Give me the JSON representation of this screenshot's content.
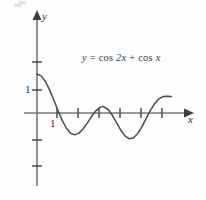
{
  "figure": {
    "title": "",
    "equation_plain": "y = cos 2x + cos x",
    "equation_parts": {
      "lhs_var": "y",
      "equals": "=",
      "term1_fn": "cos",
      "term1_arg": "2x",
      "plus": "+",
      "term2_fn": "cos",
      "term2_arg": "x"
    },
    "axis_label_x": "x",
    "axis_label_y": "y",
    "ytick_label": "1",
    "xtick_label": "1",
    "colors": {
      "curve": "#4a4a4a",
      "axis": "#5a5a5a",
      "text": "#2b2b2b",
      "background": "#fdfdfd"
    }
  },
  "chart_data": {
    "type": "line",
    "title": "",
    "subtitle": "",
    "xlabel": "x",
    "ylabel": "y",
    "annotations": [
      {
        "text": "y = cos 2x + cos x",
        "x": 3.9,
        "y": 1.95
      }
    ],
    "grid": false,
    "legend": null,
    "xlim": [
      -0.75,
      7.6
    ],
    "ylim": [
      -2.6,
      3.1
    ],
    "xticks": [
      1,
      2,
      3,
      4,
      5
    ],
    "xtick_labels": [
      "1",
      "",
      "",
      "",
      ""
    ],
    "yticks": [
      -2,
      -1,
      1,
      2
    ],
    "ytick_labels": [
      "",
      "",
      "1",
      ""
    ],
    "axes_arrows": {
      "x_positive": true,
      "y_positive": true
    },
    "series": [
      {
        "name": "y = cos 2x + cos x",
        "formula": "cos(2x) + cos(x)",
        "x": [
          0,
          0.2,
          0.4,
          0.6,
          0.8,
          1.0,
          1.2,
          1.4,
          1.6,
          1.8,
          2.0,
          2.2,
          2.4,
          2.6,
          2.8,
          3.0,
          3.14159,
          3.4,
          3.6,
          3.8,
          4.0,
          4.2,
          4.4,
          4.6,
          4.8,
          5.0,
          5.2,
          5.4,
          5.6,
          5.8,
          6.0,
          6.2,
          6.4
        ],
        "y": [
          2.0,
          1.902,
          1.617,
          1.187,
          0.67,
          0.124,
          -0.38,
          -0.783,
          -1.04,
          -1.12,
          -1.033,
          -0.81,
          -0.503,
          -0.177,
          0.106,
          0.29,
          0.34,
          0.167,
          -0.142,
          -0.522,
          -0.9,
          -1.188,
          -1.323,
          -1.273,
          -1.048,
          -0.695,
          -0.28,
          0.132,
          0.48,
          0.72,
          0.84,
          0.86,
          0.85
        ],
        "key_points": {
          "y_intercept": 2.0,
          "x_intercepts_approx": [
            1.05,
            2.73,
            3.54,
            5.48
          ],
          "local_minima": [
            {
              "x": 1.83,
              "y": -1.125
            },
            {
              "x": 4.45,
              "y": -1.325
            }
          ],
          "local_maximum": [
            {
              "x": 3.14159,
              "y": 0.34
            }
          ]
        }
      }
    ]
  }
}
